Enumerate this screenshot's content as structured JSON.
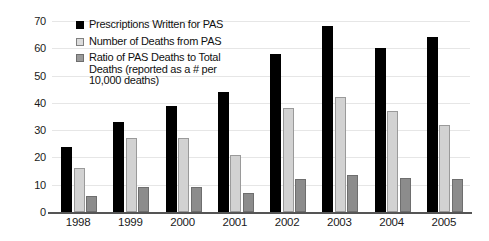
{
  "chart_data": {
    "type": "bar",
    "title": "",
    "xlabel": "",
    "ylabel": "",
    "categories": [
      "1998",
      "1999",
      "2000",
      "2001",
      "2002",
      "2003",
      "2004",
      "2005"
    ],
    "ylim": [
      0,
      70
    ],
    "yticks": [
      0,
      10,
      20,
      30,
      40,
      50,
      60,
      70
    ],
    "grid": true,
    "legend_position": "top-left-inside",
    "series": [
      {
        "name": "Prescriptions Written for PAS",
        "color": "#000000",
        "values": [
          24,
          33,
          39,
          44,
          58,
          68,
          60,
          64
        ]
      },
      {
        "name": "Number of Deaths from PAS",
        "color": "#d2d2d2",
        "values": [
          16,
          27,
          27,
          21,
          38,
          42,
          37,
          32
        ]
      },
      {
        "name": "Ratio of PAS Deaths to Total\nDeaths (reported as a # per\n10,000 deaths)",
        "color": "#8c8c8c",
        "values": [
          6,
          9,
          9,
          7,
          12,
          13.5,
          12.5,
          12
        ]
      }
    ]
  },
  "axis": {
    "y_tick_labels": [
      "0",
      "10",
      "20",
      "30",
      "40",
      "50",
      "60",
      "70"
    ],
    "x_tick_labels": [
      "1998",
      "1999",
      "2000",
      "2001",
      "2002",
      "2003",
      "2004",
      "2005"
    ]
  },
  "legend": {
    "items": [
      {
        "label": "Prescriptions Written for PAS",
        "swatch": "black-square-icon"
      },
      {
        "label": "Number of Deaths from PAS",
        "swatch": "light-gray-square-icon"
      },
      {
        "label": "Ratio of PAS Deaths to Total\nDeaths (reported as a # per\n10,000 deaths)",
        "swatch": "gray-square-icon"
      }
    ]
  }
}
